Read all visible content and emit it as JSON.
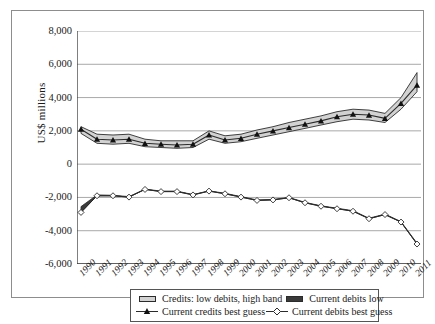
{
  "chart_data": {
    "type": "line",
    "title": "",
    "xlabel": "",
    "ylabel": "US$ millions",
    "ylim": [
      -6000,
      8000
    ],
    "ytick_values": [
      8000,
      6000,
      4000,
      2000,
      0,
      -2000,
      -4000,
      -6000
    ],
    "ytick_labels": [
      "8,000",
      "6,000",
      "4,000",
      "2,000",
      "0",
      "-2,000",
      "-4,000",
      "-6,000"
    ],
    "grid": true,
    "legend_position": "bottom",
    "categories": [
      "1990",
      "1991",
      "1992",
      "1993",
      "1994",
      "1995",
      "1996",
      "1997",
      "1998",
      "1999",
      "2000",
      "2001",
      "2002",
      "2003",
      "2004",
      "2005",
      "2006",
      "2007",
      "2008",
      "2009",
      "2010",
      "2011"
    ],
    "series": [
      {
        "name": "Credits: low debits, high band",
        "role": "band-upper",
        "values": [
          2250,
          1800,
          1750,
          1800,
          1500,
          1400,
          1400,
          1400,
          2000,
          1700,
          1800,
          2050,
          2250,
          2500,
          2700,
          2900,
          3150,
          3300,
          3250,
          3050,
          4000,
          5500
        ]
      },
      {
        "name": "Credits: low debits, low band",
        "role": "band-lower",
        "values": [
          1850,
          1250,
          1200,
          1250,
          1050,
          1000,
          950,
          1000,
          1500,
          1250,
          1350,
          1550,
          1750,
          1950,
          2150,
          2350,
          2550,
          2700,
          2650,
          2500,
          3300,
          4350
        ]
      },
      {
        "name": "Current credits best guess",
        "role": "line-filled-triangle",
        "values": [
          2100,
          1500,
          1450,
          1500,
          1250,
          1200,
          1150,
          1200,
          1750,
          1450,
          1550,
          1800,
          2000,
          2200,
          2400,
          2600,
          2850,
          3000,
          2950,
          2750,
          3650,
          4750
        ]
      },
      {
        "name": "Current debits low",
        "role": "band-debits",
        "values": [
          -2550,
          -1850,
          -1870,
          -1950,
          -1500,
          -1620,
          -1620,
          -1830,
          -1600,
          -1750,
          -1950,
          -2150,
          -2120,
          -2000,
          -2300,
          -2500,
          -2650,
          -2800,
          -3250,
          -3000,
          -3450,
          -4750
        ]
      },
      {
        "name": "Current debits best guess",
        "role": "line-open-diamond",
        "values": [
          -2900,
          -1900,
          -1900,
          -1980,
          -1520,
          -1650,
          -1650,
          -1850,
          -1620,
          -1780,
          -1980,
          -2180,
          -2150,
          -2020,
          -2320,
          -2530,
          -2680,
          -2830,
          -3280,
          -3030,
          -3480,
          -4800
        ]
      }
    ],
    "legend": [
      {
        "label": "Credits: low debits, high band",
        "key": "band-light"
      },
      {
        "label": "Current debits low",
        "key": "band-dark"
      },
      {
        "label": "Current credits best guess",
        "key": "line-triangle"
      },
      {
        "label": "Current debits best guess",
        "key": "line-diamond"
      }
    ],
    "colors": {
      "band_fill": "#d2d2d2",
      "line": "#2b2b2b",
      "grid": "#a9a9a9",
      "axis": "#3a3a3a",
      "frame": "#8d8d8d",
      "background": "#ffffff"
    }
  }
}
